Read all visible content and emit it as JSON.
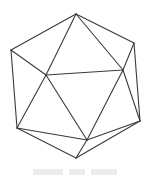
{
  "figure": {
    "stroke_color": "#3a3a3a",
    "stroke_width": 1.1,
    "vertices": {
      "A": [
        76,
        14
      ],
      "B": [
        11,
        50
      ],
      "C": [
        134,
        43
      ],
      "D": [
        46,
        75
      ],
      "E": [
        123,
        70
      ],
      "F": [
        17,
        128
      ],
      "G": [
        140,
        121
      ],
      "H": [
        87,
        140
      ],
      "I": [
        76,
        158
      ]
    },
    "edges": [
      [
        "A",
        "B"
      ],
      [
        "A",
        "C"
      ],
      [
        "A",
        "D"
      ],
      [
        "A",
        "E"
      ],
      [
        "B",
        "D"
      ],
      [
        "B",
        "F"
      ],
      [
        "C",
        "E"
      ],
      [
        "C",
        "G"
      ],
      [
        "D",
        "E"
      ],
      [
        "D",
        "F"
      ],
      [
        "D",
        "H"
      ],
      [
        "E",
        "H"
      ],
      [
        "E",
        "G"
      ],
      [
        "F",
        "H"
      ],
      [
        "F",
        "I"
      ],
      [
        "H",
        "I"
      ],
      [
        "H",
        "G"
      ],
      [
        "I",
        "G"
      ]
    ]
  },
  "caption": {
    "text": "",
    "legible": false,
    "color": "#ececec"
  }
}
